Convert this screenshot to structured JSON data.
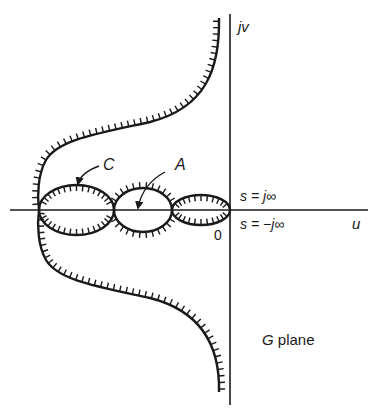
{
  "diagram": {
    "type": "nyquist-plot",
    "plane_label": {
      "var": "G",
      "suffix": " plane"
    },
    "axes": {
      "real_axis_label": "u",
      "imag_axis_label": "jv",
      "origin_label": "0"
    },
    "annotations": {
      "s_pos_inf": "s = j∞",
      "s_neg_inf": "s = −j∞"
    },
    "regions": [
      {
        "label": "C",
        "description": "left loop (encircled region)"
      },
      {
        "label": "A",
        "description": "middle loop (encircled region)"
      }
    ],
    "colors": {
      "ink": "#1a1a1a",
      "background": "#ffffff"
    }
  }
}
